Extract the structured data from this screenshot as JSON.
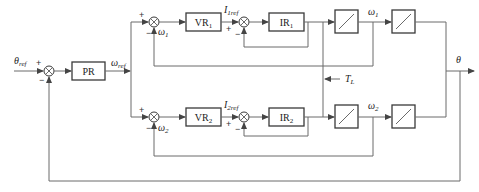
{
  "diagram": {
    "type": "block-diagram",
    "input": {
      "symbol": "θ",
      "subscript": "ref"
    },
    "output": {
      "symbol": "θ"
    },
    "blocks": {
      "position_controller": "PR",
      "speed_controller_1": {
        "main": "VR",
        "sub": "1"
      },
      "current_controller_1": {
        "main": "IR",
        "sub": "1"
      },
      "speed_controller_2": {
        "main": "VR",
        "sub": "2"
      },
      "current_controller_2": {
        "main": "IR",
        "sub": "2"
      }
    },
    "signals": {
      "speed_ref": {
        "symbol": "ω",
        "subscript": "ref"
      },
      "current_ref_1": {
        "symbol": "I",
        "subscript": "1ref"
      },
      "current_ref_2": {
        "symbol": "I",
        "subscript": "2ref"
      },
      "speed_1": {
        "symbol": "ω",
        "subscript": "1"
      },
      "speed_2": {
        "symbol": "ω",
        "subscript": "2"
      },
      "load_torque": {
        "symbol": "T",
        "subscript": "L"
      }
    },
    "signs": {
      "plus": "+",
      "minus": "−"
    }
  }
}
